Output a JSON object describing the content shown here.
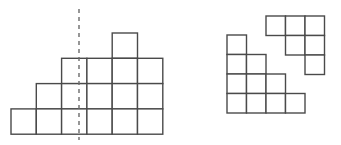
{
  "canvas": {
    "width": 341,
    "height": 145,
    "background": "#ffffff"
  },
  "style": {
    "cell_stroke": "#4a4a4a",
    "cell_fill": "#ffffff",
    "cell_stroke_width": 1.4,
    "symmetry_line_color": "#6b6b6b",
    "symmetry_line_dash": "4 4"
  },
  "figures": [
    {
      "id": "left-figure",
      "name": "symmetric-pyramid-grid",
      "description": "Stepped pyramid of unit squares with a vertical dashed line of symmetry through the center",
      "origin_x": 11,
      "origin_y": 33,
      "cell_size": 25.3,
      "rows": [
        {
          "row_index": 0,
          "y": 33,
          "count": 1,
          "start_col": 3,
          "cells": [
            3
          ]
        },
        {
          "row_index": 1,
          "y": 58,
          "count": 4,
          "start_col": 1,
          "cells": [
            1,
            2,
            3,
            4
          ]
        },
        {
          "row_index": 2,
          "y": 82,
          "count": 5,
          "start_col": 0,
          "cells": [
            0,
            1,
            2,
            3,
            4
          ]
        },
        {
          "row_index": 3,
          "y": 105,
          "count": 6,
          "start_col": -1,
          "cells": [
            -1,
            0,
            1,
            2,
            3,
            4
          ]
        }
      ],
      "total_cells": 16,
      "symmetry_line": {
        "present": true,
        "orientation": "vertical",
        "x": 79,
        "y_top": 9,
        "y_bottom": 140,
        "style": "dashed"
      }
    },
    {
      "id": "right-figure",
      "name": "two-piece-grid",
      "description": "Two separate polyomino pieces: a four-step staircase at lower left and an L-shaped piece at upper right",
      "pieces": [
        {
          "id": "staircase-piece",
          "name": "staircase-polyomino",
          "origin_x": 227,
          "origin_y": 35,
          "cell_size": 19.5,
          "rows": [
            {
              "row_index": 0,
              "count": 1,
              "cells": [
                0
              ]
            },
            {
              "row_index": 1,
              "count": 2,
              "cells": [
                0,
                1
              ]
            },
            {
              "row_index": 2,
              "count": 3,
              "cells": [
                0,
                1,
                2
              ]
            },
            {
              "row_index": 3,
              "count": 4,
              "cells": [
                0,
                1,
                2,
                3
              ]
            }
          ],
          "total_cells": 10
        },
        {
          "id": "l-shape-piece",
          "name": "l-shaped-polyomino",
          "origin_x": 266,
          "origin_y": 16,
          "cell_size": 19.5,
          "rows": [
            {
              "row_index": 0,
              "count": 3,
              "cells": [
                0,
                1,
                2
              ]
            },
            {
              "row_index": 1,
              "count": 2,
              "cells": [
                1,
                2
              ]
            },
            {
              "row_index": 2,
              "count": 1,
              "cells": [
                2
              ]
            }
          ],
          "total_cells": 6
        }
      ]
    }
  ],
  "labels": {
    "none_visible": ""
  }
}
